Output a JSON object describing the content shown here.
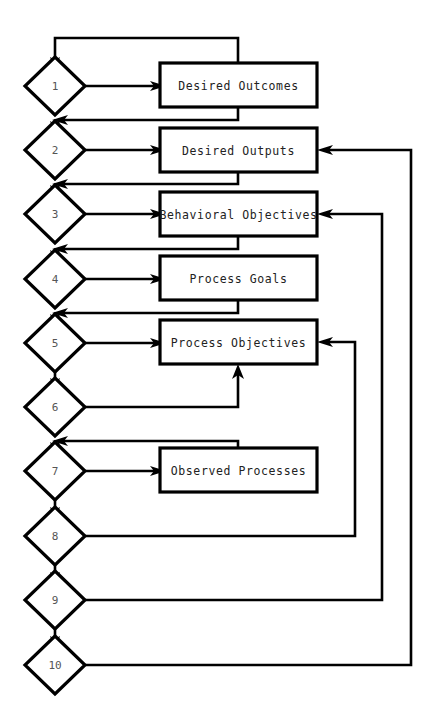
{
  "diagram": {
    "canvas": {
      "width": 435,
      "height": 710,
      "background": "#ffffff"
    },
    "stroke_color": "#000000",
    "box_fill": "#ffffff",
    "decision_nodes": [
      {
        "id": "d1",
        "label": "1",
        "cx": 55,
        "cy": 86
      },
      {
        "id": "d2",
        "label": "2",
        "cx": 55,
        "cy": 150
      },
      {
        "id": "d3",
        "label": "3",
        "cx": 55,
        "cy": 214
      },
      {
        "id": "d4",
        "label": "4",
        "cx": 55,
        "cy": 279
      },
      {
        "id": "d5",
        "label": "5",
        "cx": 55,
        "cy": 343
      },
      {
        "id": "d6",
        "label": "6",
        "cx": 55,
        "cy": 407
      },
      {
        "id": "d7",
        "label": "7",
        "cx": 55,
        "cy": 471
      },
      {
        "id": "d8",
        "label": "8",
        "cx": 55,
        "cy": 536
      },
      {
        "id": "d9",
        "label": "9",
        "cx": 55,
        "cy": 600
      },
      {
        "id": "d10",
        "label": "10",
        "cx": 55,
        "cy": 665
      }
    ],
    "process_boxes": [
      {
        "id": "b1",
        "label": "Desired Outcomes",
        "x": 160,
        "y": 63,
        "w": 157,
        "h": 44
      },
      {
        "id": "b2",
        "label": "Desired Outputs",
        "x": 160,
        "y": 128,
        "w": 157,
        "h": 44
      },
      {
        "id": "b3",
        "label": "Behavioral Objectives",
        "x": 160,
        "y": 192,
        "w": 157,
        "h": 44
      },
      {
        "id": "b4",
        "label": "Process Goals",
        "x": 160,
        "y": 256,
        "w": 157,
        "h": 44
      },
      {
        "id": "b5",
        "label": "Process Objectives",
        "x": 160,
        "y": 320,
        "w": 157,
        "h": 44
      },
      {
        "id": "b6",
        "label": "Observed Processes",
        "x": 160,
        "y": 448,
        "w": 157,
        "h": 44
      }
    ],
    "connections": [
      {
        "from": "d1",
        "to": "b1",
        "kind": "forward"
      },
      {
        "from": "d2",
        "to": "b2",
        "kind": "forward"
      },
      {
        "from": "d3",
        "to": "b3",
        "kind": "forward"
      },
      {
        "from": "d4",
        "to": "b4",
        "kind": "forward"
      },
      {
        "from": "d5",
        "to": "b5",
        "kind": "forward"
      },
      {
        "from": "d6",
        "to": "b5",
        "kind": "forward-up"
      },
      {
        "from": "d7",
        "to": "b6",
        "kind": "forward"
      },
      {
        "from": "b1",
        "to": "d1",
        "kind": "loop-top"
      },
      {
        "from": "b1",
        "to": "d2",
        "kind": "loop-down"
      },
      {
        "from": "b2",
        "to": "d3",
        "kind": "loop-down"
      },
      {
        "from": "b3",
        "to": "d4",
        "kind": "loop-down"
      },
      {
        "from": "b4",
        "to": "d5",
        "kind": "loop-down"
      },
      {
        "from": "b6",
        "to": "d7",
        "kind": "loop-down"
      },
      {
        "from": "d8",
        "to": "b5",
        "kind": "right-return"
      },
      {
        "from": "d9",
        "to": "b3",
        "kind": "right-return"
      },
      {
        "from": "d10",
        "to": "b2",
        "kind": "right-return"
      }
    ]
  }
}
